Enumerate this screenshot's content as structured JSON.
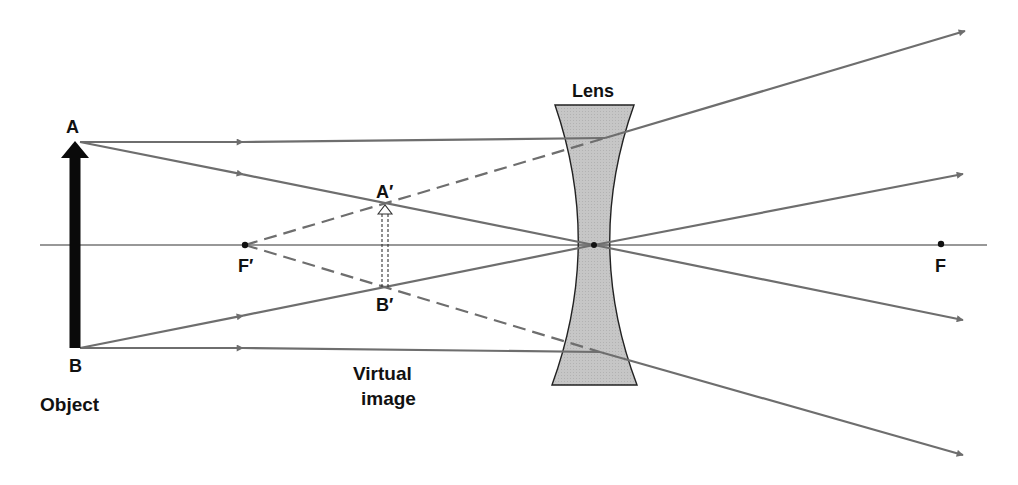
{
  "colors": {
    "ray": "#6e6e6e",
    "axis": "#333333",
    "lens_fill": "#c4c4c4",
    "lens_stroke": "#222222",
    "object": "#0a0a0a",
    "text": "#111111"
  },
  "labels": {
    "lens": "Lens",
    "object_top": "A",
    "object_bottom": "B",
    "image_top": "A′",
    "image_bottom": "B′",
    "focal_left": "F′",
    "focal_right": "F",
    "object": "Object",
    "virtual_image_line1": "Virtual",
    "virtual_image_line2": "image"
  },
  "geometry": {
    "axis": {
      "x1": 40,
      "x2": 987,
      "y": 245
    },
    "object": {
      "x": 75,
      "top": 142,
      "bottom": 348
    },
    "image": {
      "x": 385,
      "top": 205,
      "bottom": 287
    },
    "lens_center": {
      "x": 594,
      "y": 245
    },
    "focal_points": {
      "f_prime": {
        "x": 245,
        "y": 245
      },
      "f": {
        "x": 941,
        "y": 244
      }
    }
  },
  "rays": [
    {
      "name": "parallel-top",
      "points": [
        [
          80,
          142
        ],
        [
          605,
          138
        ],
        [
          965,
          31
        ]
      ],
      "virtual_extension": [
        [
          245,
          245
        ],
        [
          605,
          138
        ]
      ]
    },
    {
      "name": "chief-from-A",
      "points": [
        [
          80,
          142
        ],
        [
          594,
          245
        ],
        [
          963,
          320
        ]
      ]
    },
    {
      "name": "chief-from-B",
      "points": [
        [
          80,
          348
        ],
        [
          594,
          245
        ],
        [
          963,
          174
        ]
      ]
    },
    {
      "name": "parallel-bottom",
      "points": [
        [
          80,
          348
        ],
        [
          600,
          352
        ],
        [
          963,
          455
        ]
      ],
      "virtual_extension": [
        [
          245,
          245
        ],
        [
          600,
          352
        ]
      ]
    }
  ]
}
